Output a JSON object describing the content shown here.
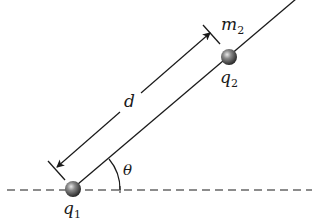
{
  "diagram": {
    "colors": {
      "line": "#1a1a1a",
      "ball_highlight": "#d0d0d0",
      "ball_mid": "#6e6e6e",
      "ball_dark": "#1e1e1e",
      "background": "#ffffff"
    },
    "labels": {
      "charge1": "q",
      "charge1_sub": "1",
      "charge2": "q",
      "charge2_sub": "2",
      "mass2": "m",
      "mass2_sub": "2",
      "distance": "d",
      "angle": "θ"
    },
    "particles": [
      {
        "name": "q1",
        "cx": 73,
        "cy": 189,
        "r": 8
      },
      {
        "name": "q2",
        "cx": 229,
        "cy": 57,
        "r": 8
      }
    ]
  }
}
